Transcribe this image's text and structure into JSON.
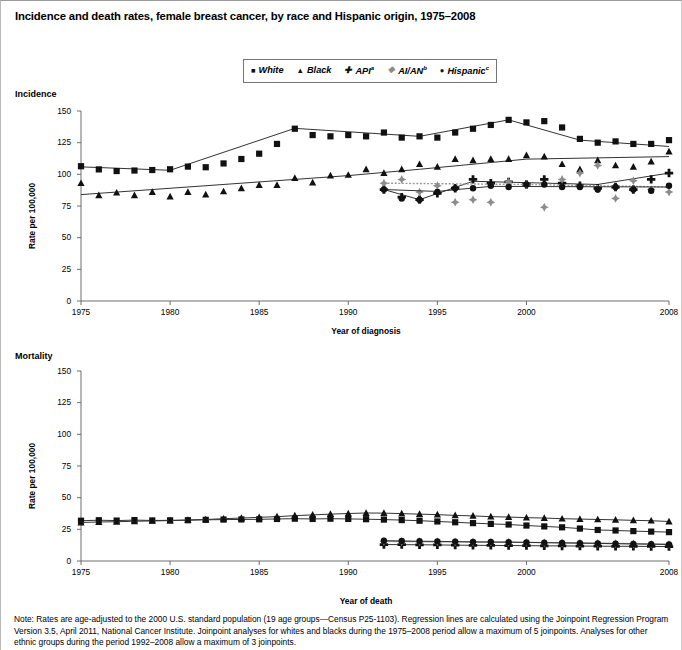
{
  "figure": {
    "title": "Incidence and death rates, female breast cancer, by race and Hispanic origin, 1975–2008",
    "note": "Note: Rates are age-adjusted to the 2000 U.S. standard population (19 age groups—Census P25-1103). Regression lines are calculated using the Joinpoint Regression Program Version 3.5, April 2011, National Cancer Institute. Joinpoint analyses for whites and blacks during the 1975–2008 period allow a maximum of 5 joinpoints. Analyses for other ethnic groups during the period 1992–2008 allow a maximum of 3 joinpoints."
  },
  "legend": {
    "position": "top-center",
    "entries": [
      {
        "label": "White",
        "marker": "square-marker",
        "glyph": "■",
        "sup": "",
        "color": "#111111"
      },
      {
        "label": "Black",
        "marker": "triangle-marker",
        "glyph": "▲",
        "sup": "",
        "color": "#111111"
      },
      {
        "label": "API",
        "marker": "plus-marker",
        "glyph": "✚",
        "sup": "a",
        "color": "#111111"
      },
      {
        "label": "AI/AN",
        "marker": "diamond-marker",
        "glyph": "❖",
        "sup": "b",
        "color": "#8c8c8c"
      },
      {
        "label": "Hispanic",
        "marker": "circle-marker",
        "glyph": "●",
        "sup": "c",
        "color": "#111111"
      }
    ]
  },
  "panels": [
    {
      "key": "incidence",
      "label": "Incidence",
      "xlabel": "Year of diagnosis",
      "ylabel": "Rate per 100,000"
    },
    {
      "key": "mortality",
      "label": "Mortality",
      "xlabel": "Year of death",
      "ylabel": "Rate per 100,000"
    }
  ],
  "chart_data": [
    {
      "type": "line",
      "panel": "incidence",
      "title": "Incidence",
      "xlabel": "Year of diagnosis",
      "ylabel": "Rate per 100,000",
      "xlim": [
        1975,
        2008
      ],
      "ylim": [
        0,
        150
      ],
      "yticks": [
        0,
        25,
        50,
        75,
        100,
        125,
        150
      ],
      "xticks": [
        1975,
        1980,
        1985,
        1990,
        1995,
        2000,
        2008
      ],
      "grid": false,
      "legend": "top-center",
      "series": [
        {
          "name": "White",
          "marker": "square",
          "x": [
            1975,
            1976,
            1977,
            1978,
            1979,
            1980,
            1981,
            1982,
            1983,
            1984,
            1985,
            1986,
            1987,
            1988,
            1989,
            1990,
            1991,
            1992,
            1993,
            1994,
            1995,
            1996,
            1997,
            1998,
            1999,
            2000,
            2001,
            2002,
            2003,
            2004,
            2005,
            2006,
            2007,
            2008
          ],
          "y": [
            106.4,
            103.9,
            102.6,
            103.0,
            103.4,
            104.0,
            106.1,
            105.6,
            108.6,
            112.1,
            116.3,
            124.0,
            136.0,
            131.0,
            130.0,
            131.0,
            130.0,
            133.0,
            129.0,
            130.0,
            129.0,
            133.0,
            136.0,
            139.0,
            143.0,
            141.0,
            142.0,
            137.0,
            128.0,
            125.0,
            126.0,
            124.0,
            124.0,
            127.0
          ],
          "fit": [
            [
              1975,
              105.9
            ],
            [
              1980,
              103.2
            ],
            [
              1987,
              136.3
            ],
            [
              1994,
              130.0
            ],
            [
              1999,
              143.0
            ],
            [
              2003,
              127.0
            ],
            [
              2008,
              122.0
            ]
          ]
        },
        {
          "name": "Black",
          "marker": "triangle",
          "x": [
            1975,
            1976,
            1977,
            1978,
            1979,
            1980,
            1981,
            1982,
            1983,
            1984,
            1985,
            1986,
            1987,
            1988,
            1989,
            1990,
            1991,
            1992,
            1993,
            1994,
            1995,
            1996,
            1997,
            1998,
            1999,
            2000,
            2001,
            2002,
            2003,
            2004,
            2005,
            2006,
            2007,
            2008
          ],
          "y": [
            93.0,
            83.5,
            85.5,
            83.5,
            86.0,
            82.5,
            86.0,
            84.0,
            86.5,
            89.0,
            91.5,
            91.5,
            97.0,
            93.5,
            99.0,
            99.5,
            104.0,
            101.0,
            104.0,
            108.0,
            106.0,
            112.0,
            111.0,
            112.0,
            112.0,
            115.0,
            114.0,
            108.0,
            104.0,
            111.0,
            107.0,
            106.0,
            110.0,
            118.0
          ],
          "fit": [
            [
              1975,
              84.0
            ],
            [
              1990,
              99.0
            ],
            [
              1994,
              104.0
            ],
            [
              2000,
              112.0
            ],
            [
              2008,
              114.0
            ]
          ]
        },
        {
          "name": "API",
          "marker": "plus",
          "x": [
            1992,
            1993,
            1994,
            1995,
            1996,
            1997,
            1998,
            1999,
            2000,
            2001,
            2002,
            2003,
            2004,
            2005,
            2006,
            2007,
            2008
          ],
          "y": [
            88.0,
            82.0,
            80.0,
            85.0,
            89.0,
            96.0,
            93.0,
            94.0,
            92.0,
            96.0,
            93.0,
            91.0,
            89.0,
            90.0,
            88.0,
            96.0,
            101.0
          ],
          "fit": [
            [
              1992,
              88.0
            ],
            [
              1994,
              80.0
            ],
            [
              1997,
              94.5
            ],
            [
              2004,
              92.0
            ],
            [
              2008,
              101.0
            ]
          ]
        },
        {
          "name": "AI/AN",
          "marker": "diamond",
          "x": [
            1992,
            1993,
            1994,
            1995,
            1996,
            1997,
            1998,
            1999,
            2000,
            2001,
            2002,
            2003,
            2004,
            2005,
            2006,
            2007,
            2008
          ],
          "y": [
            93.0,
            96.0,
            86.0,
            91.0,
            78.0,
            80.0,
            78.0,
            94.0,
            92.0,
            74.0,
            96.0,
            101.0,
            107.0,
            81.0,
            95.0,
            88.0,
            86.0
          ],
          "fit": [
            [
              1992,
              93.0
            ],
            [
              2000,
              92.0
            ],
            [
              2008,
              90.0
            ]
          ]
        },
        {
          "name": "Hispanic",
          "marker": "circle",
          "x": [
            1992,
            1993,
            1994,
            1995,
            1996,
            1997,
            1998,
            1999,
            2000,
            2001,
            2002,
            2003,
            2004,
            2005,
            2006,
            2007,
            2008
          ],
          "y": [
            88.0,
            81.0,
            80.0,
            86.0,
            89.0,
            89.0,
            91.0,
            90.0,
            92.0,
            92.0,
            90.0,
            90.0,
            88.0,
            90.0,
            88.0,
            87.0,
            91.0
          ],
          "fit": [
            [
              1992,
              88.0
            ],
            [
              1995,
              86.5
            ],
            [
              1998,
              90.5
            ],
            [
              2008,
              90.0
            ]
          ]
        }
      ]
    },
    {
      "type": "line",
      "panel": "mortality",
      "title": "Mortality",
      "xlabel": "Year of death",
      "ylabel": "Rate per 100,000",
      "xlim": [
        1975,
        2008
      ],
      "ylim": [
        0,
        150
      ],
      "yticks": [
        0,
        25,
        50,
        75,
        100,
        125,
        150
      ],
      "xticks": [
        1975,
        1980,
        1985,
        1990,
        1995,
        2000,
        2008
      ],
      "grid": false,
      "legend": "top-center",
      "series": [
        {
          "name": "White",
          "marker": "square",
          "x": [
            1975,
            1976,
            1977,
            1978,
            1979,
            1980,
            1981,
            1982,
            1983,
            1984,
            1985,
            1986,
            1987,
            1988,
            1989,
            1990,
            1991,
            1992,
            1993,
            1994,
            1995,
            1996,
            1997,
            1998,
            1999,
            2000,
            2001,
            2002,
            2003,
            2004,
            2005,
            2006,
            2007,
            2008
          ],
          "y": [
            31.8,
            32.2,
            31.9,
            32.3,
            32.0,
            32.1,
            32.2,
            32.5,
            32.7,
            32.8,
            32.9,
            33.2,
            33.4,
            33.2,
            33.4,
            33.2,
            33.0,
            32.7,
            32.3,
            31.8,
            31.2,
            30.6,
            29.9,
            29.3,
            28.8,
            28.0,
            27.3,
            26.6,
            25.6,
            24.5,
            24.1,
            23.6,
            23.2,
            22.8
          ]
        },
        {
          "name": "Black",
          "marker": "triangle",
          "x": [
            1975,
            1976,
            1977,
            1978,
            1979,
            1980,
            1981,
            1982,
            1983,
            1984,
            1985,
            1986,
            1987,
            1988,
            1989,
            1990,
            1991,
            1992,
            1993,
            1994,
            1995,
            1996,
            1997,
            1998,
            1999,
            2000,
            2001,
            2002,
            2003,
            2004,
            2005,
            2006,
            2007,
            2008
          ],
          "y": [
            30.4,
            30.8,
            31.0,
            31.4,
            31.6,
            31.9,
            32.4,
            32.8,
            33.4,
            33.9,
            34.5,
            35.0,
            35.8,
            36.4,
            37.0,
            37.5,
            37.9,
            37.8,
            37.4,
            37.0,
            36.6,
            36.0,
            35.6,
            35.0,
            34.7,
            34.2,
            33.9,
            33.4,
            33.1,
            32.8,
            32.5,
            32.1,
            31.8,
            31.2
          ]
        },
        {
          "name": "API",
          "marker": "plus",
          "x": [
            1992,
            1993,
            1994,
            1995,
            1996,
            1997,
            1998,
            1999,
            2000,
            2001,
            2002,
            2003,
            2004,
            2005,
            2006,
            2007,
            2008
          ],
          "y": [
            13.0,
            12.9,
            12.8,
            12.7,
            12.5,
            12.4,
            12.3,
            12.2,
            12.1,
            12.0,
            11.9,
            11.8,
            11.7,
            11.6,
            11.6,
            11.5,
            11.4
          ]
        },
        {
          "name": "AI/AN",
          "marker": "diamond",
          "x": [
            1992,
            1993,
            1994,
            1995,
            1996,
            1997,
            1998,
            1999,
            2000,
            2001,
            2002,
            2003,
            2004,
            2005,
            2006,
            2007,
            2008
          ],
          "y": [
            15.5,
            15.4,
            15.3,
            15.2,
            15.1,
            15.0,
            14.9,
            14.8,
            14.7,
            14.5,
            14.4,
            14.2,
            14.0,
            13.8,
            13.6,
            13.4,
            13.2
          ]
        },
        {
          "name": "Hispanic",
          "marker": "circle",
          "x": [
            1992,
            1993,
            1994,
            1995,
            1996,
            1997,
            1998,
            1999,
            2000,
            2001,
            2002,
            2003,
            2004,
            2005,
            2006,
            2007,
            2008
          ],
          "y": [
            16.0,
            15.8,
            15.6,
            15.5,
            15.3,
            15.1,
            15.0,
            14.9,
            14.7,
            14.5,
            14.3,
            14.1,
            13.9,
            13.7,
            13.5,
            13.3,
            13.0
          ]
        }
      ]
    }
  ]
}
